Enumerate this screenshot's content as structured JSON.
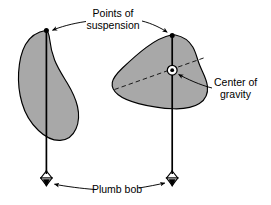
{
  "figure": {
    "kind": "physics-diagram",
    "title_text": "",
    "background_color": "#ffffff",
    "body_fill_color": "#a8a8a8",
    "outline_color": "#000000",
    "plumb_line_color": "#000000",
    "dashed_axis_color": "#1a1a1a",
    "leader_line_color": "#000000",
    "text_color": "#000000",
    "width": 271,
    "height": 205
  },
  "labels": {
    "points_of_suspension": {
      "line1": "Points of",
      "line2": "suspension",
      "x": 113,
      "y1": 14,
      "y2": 26
    },
    "center_of_gravity": {
      "line1": "Center of",
      "line2": "gravity",
      "x": 214,
      "y1": 83,
      "y2": 95
    },
    "plumb_bob": {
      "line1": "Plumb bob",
      "x": 111,
      "y1": 190
    }
  },
  "bodies": [
    {
      "name": "pear-shaped-body",
      "suspension_point": {
        "x": 46,
        "y": 30
      },
      "plumb_bob_point": {
        "x": 46,
        "y": 180
      },
      "bounds": {
        "x_min": 18,
        "x_max": 78,
        "y_min": 30,
        "y_max": 141
      },
      "has_center_of_gravity_marker": false,
      "has_dashed_axis": false
    },
    {
      "name": "rounded-blob-body",
      "suspension_point": {
        "x": 172,
        "y": 35
      },
      "plumb_bob_point": {
        "x": 172,
        "y": 180
      },
      "center_of_gravity": {
        "x": 172,
        "y": 70
      },
      "bounds": {
        "x_min": 112,
        "x_max": 206,
        "y_min": 33,
        "y_max": 109
      },
      "has_center_of_gravity_marker": true,
      "has_dashed_axis": true,
      "dashed_axis": {
        "x1": 114,
        "y1": 89,
        "x2": 205,
        "y2": 57
      }
    }
  ],
  "annotations": {
    "suspension_leader_left": {
      "from_x": 84,
      "from_y": 22,
      "to_x": 50,
      "to_y": 31
    },
    "suspension_leader_right": {
      "from_x": 143,
      "from_y": 22,
      "to_x": 169,
      "to_y": 33
    },
    "gravity_leader": {
      "from_x": 211,
      "from_y": 88,
      "to_x": 177,
      "to_y": 74
    },
    "plumb_leader_left": {
      "from_x": 96,
      "from_y": 190,
      "to_x": 52,
      "to_y": 184
    },
    "plumb_leader_right": {
      "from_x": 140,
      "from_y": 188,
      "to_x": 166,
      "to_y": 183
    }
  }
}
